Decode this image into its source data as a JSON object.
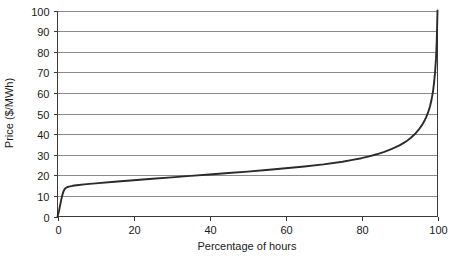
{
  "chart_data": {
    "type": "line",
    "title": "",
    "xlabel": "Percentage of hours",
    "ylabel": "Price ($/MWh)",
    "xlim": [
      0,
      100
    ],
    "ylim": [
      0,
      100
    ],
    "xticks": [
      0,
      20,
      40,
      60,
      80,
      100
    ],
    "yticks": [
      0,
      10,
      20,
      30,
      40,
      50,
      60,
      70,
      80,
      90,
      100
    ],
    "grid": "horizontal",
    "legend": "none",
    "series": [
      {
        "name": "Price duration curve",
        "color": "#2b2b2b",
        "x": [
          0,
          0.2,
          0.4,
          0.7,
          1.0,
          1.3,
          1.6,
          2.0,
          2.5,
          3.0,
          4.0,
          5.0,
          7.0,
          10.0,
          15.0,
          20.0,
          25.0,
          30.0,
          35.0,
          40.0,
          45.0,
          50.0,
          55.0,
          60.0,
          65.0,
          70.0,
          75.0,
          78.0,
          80.0,
          82.0,
          84.0,
          86.0,
          88.0,
          90.0,
          91.0,
          92.0,
          93.0,
          94.0,
          95.0,
          96.0,
          96.5,
          97.0,
          97.5,
          98.0,
          98.4,
          98.8,
          99.1,
          99.4,
          99.6,
          99.8,
          100.0
        ],
        "y": [
          0,
          1.2,
          2.8,
          5.5,
          8.3,
          10.6,
          12.3,
          13.6,
          14.2,
          14.5,
          14.9,
          15.2,
          15.6,
          16.1,
          16.9,
          17.6,
          18.3,
          19.0,
          19.7,
          20.4,
          21.1,
          21.8,
          22.6,
          23.4,
          24.3,
          25.3,
          26.6,
          27.6,
          28.3,
          29.2,
          30.2,
          31.4,
          32.8,
          34.5,
          35.6,
          36.8,
          38.2,
          39.9,
          42.0,
          44.6,
          46.2,
          48.1,
          50.4,
          53.3,
          56.4,
          60.5,
          65.0,
          71.0,
          76.5,
          85.0,
          100.0
        ]
      }
    ]
  },
  "axes": {
    "y_axis_label": "Price ($/MWh)",
    "x_axis_label": "Percentage of hours",
    "y_tick_labels": [
      "100",
      "90",
      "80",
      "70",
      "60",
      "50",
      "40",
      "30",
      "20",
      "10",
      "0"
    ],
    "x_tick_labels": [
      "0",
      "20",
      "40",
      "60",
      "80",
      "100"
    ]
  },
  "colors": {
    "series": "#2b2b2b",
    "grid": "#8a8a8a",
    "frame": "#3a3a3a",
    "background": "#ffffff",
    "text": "#1a1a1a"
  }
}
